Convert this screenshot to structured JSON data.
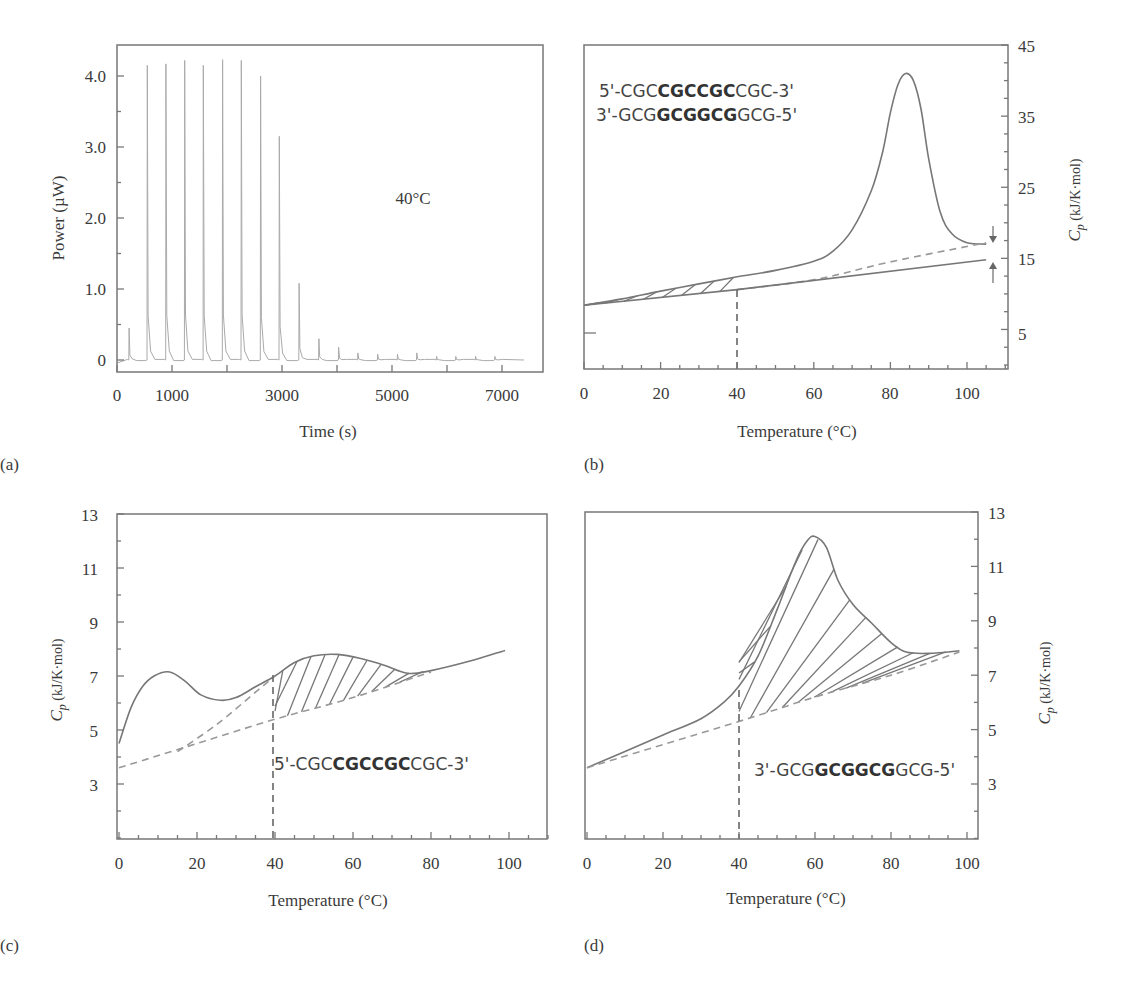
{
  "figure": {
    "panels": [
      {
        "id": "a",
        "label": "(a)"
      },
      {
        "id": "b",
        "label": "(b)"
      },
      {
        "id": "c",
        "label": "(c)"
      },
      {
        "id": "d",
        "label": "(d)"
      }
    ]
  },
  "panel_a": {
    "label": "(a)",
    "ylabel": "Power (µW)",
    "xlabel": "Time (s)",
    "annotation": "40°C",
    "yticks": [
      "0",
      "1.0",
      "2.0",
      "3.0",
      "4.0"
    ],
    "xticks": [
      "0",
      "1000",
      "3000",
      "5000",
      "7000"
    ]
  },
  "panel_b": {
    "label": "(b)",
    "xlabel": "Temperature (°C)",
    "ylabel_main": "C",
    "ylabel_sub": "p",
    "ylabel_units": " (kJ/K·mol)",
    "seq_top": {
      "pre": "5'-CGC",
      "bold": "CGCCGC",
      "post": "CGC-3'"
    },
    "seq_bottom": {
      "pre": "3'-GCG",
      "bold": "GCGGCG",
      "post": "GCG-5'"
    },
    "yticks": [
      "5",
      "15",
      "25",
      "35",
      "45"
    ],
    "xticks": [
      "0",
      "20",
      "40",
      "60",
      "80",
      "100"
    ]
  },
  "panel_c": {
    "label": "(c)",
    "xlabel": "Temperature (°C)",
    "ylabel_main": "C",
    "ylabel_sub": "p",
    "ylabel_units": " (kJ/K·mol)",
    "seq": {
      "pre": "5'-CGC",
      "bold": "CGCCGC",
      "post": "CGC-3'"
    },
    "yticks": [
      "3",
      "5",
      "7",
      "9",
      "11",
      "13"
    ],
    "xticks": [
      "0",
      "20",
      "40",
      "60",
      "80",
      "100"
    ]
  },
  "panel_d": {
    "label": "(d)",
    "xlabel": "Temperature (°C)",
    "ylabel_main": "C",
    "ylabel_sub": "p",
    "ylabel_units": " (kJ/K·mol)",
    "seq": {
      "pre": "3'-GCG",
      "bold": "GCGGCG",
      "post": "GCG-5'"
    },
    "yticks": [
      "3",
      "5",
      "7",
      "9",
      "11",
      "13"
    ],
    "xticks": [
      "0",
      "20",
      "40",
      "60",
      "80",
      "100"
    ]
  },
  "chart_data": [
    {
      "panel": "a",
      "type": "line",
      "title": "",
      "xlabel": "Time (s)",
      "ylabel": "Power (µW)",
      "annotations": [
        "40°C"
      ],
      "xlim": [
        0,
        7800
      ],
      "ylim": [
        -0.25,
        4.5
      ],
      "xticks": [
        0,
        1000,
        3000,
        5000,
        7000
      ],
      "yticks": [
        0,
        1.0,
        2.0,
        3.0,
        4.0
      ],
      "grid": false,
      "series": [
        {
          "name": "titration injection peaks",
          "peaks_x": [
            220,
            550,
            890,
            1230,
            1570,
            1920,
            2260,
            2610,
            2950,
            3310,
            3670,
            4030,
            4380,
            4740,
            5100,
            5450,
            5810,
            6160,
            6520,
            6870
          ],
          "peaks_y": [
            0.45,
            4.15,
            4.17,
            4.22,
            4.15,
            4.23,
            4.22,
            4.0,
            3.15,
            1.08,
            0.3,
            0.18,
            0.1,
            0.08,
            0.08,
            0.1,
            0.05,
            0.05,
            0.05,
            0.05
          ],
          "baseline": 0.0,
          "x_end": 7400
        }
      ]
    },
    {
      "panel": "b",
      "type": "line",
      "xlabel": "Temperature (°C)",
      "ylabel": "Cp (kJ/K·mol)",
      "y_axis_side": "right",
      "annotations": [
        "5'-CGCCGCCGCCGC-3'",
        "3'-GCGGCGGCGGCG-5'"
      ],
      "xlim": [
        0,
        110
      ],
      "ylim": [
        0,
        45
      ],
      "xticks": [
        0,
        20,
        40,
        60,
        80,
        100
      ],
      "yticks": [
        5,
        15,
        25,
        35,
        45
      ],
      "vertical_dashed_line_x": 40,
      "series": [
        {
          "name": "duplex melting curve",
          "style": "solid",
          "x": [
            0,
            10,
            20,
            30,
            40,
            50,
            60,
            65,
            70,
            75,
            78,
            80,
            82,
            84,
            86,
            88,
            90,
            93,
            96,
            100,
            105
          ],
          "y": [
            8.4,
            9.3,
            10.4,
            11.4,
            12.4,
            13.3,
            14.6,
            16.0,
            19.0,
            24.5,
            30.0,
            35.5,
            39.5,
            41.0,
            40.0,
            36.0,
            29.0,
            21.5,
            18.5,
            17.2,
            17.0
          ]
        },
        {
          "name": "dashed baseline",
          "style": "dashed",
          "x": [
            40,
            60,
            80,
            105
          ],
          "y": [
            10.6,
            12.0,
            14.5,
            17.2
          ]
        },
        {
          "name": "solid baseline",
          "style": "solid",
          "x": [
            0,
            40,
            105
          ],
          "y": [
            8.4,
            10.6,
            14.8
          ]
        },
        {
          "name": "hatched area",
          "range_x": [
            0,
            40
          ]
        }
      ]
    },
    {
      "panel": "c",
      "type": "line",
      "xlabel": "Temperature (°C)",
      "ylabel": "Cp (kJ/K·mol)",
      "annotations": [
        "5'-CGCCGCCGCCGC-3'"
      ],
      "xlim": [
        0,
        110
      ],
      "ylim": [
        1,
        13
      ],
      "xticks": [
        0,
        20,
        40,
        60,
        80,
        100
      ],
      "yticks": [
        3,
        5,
        7,
        9,
        11,
        13
      ],
      "vertical_dashed_line_x": 40,
      "series": [
        {
          "name": "single strand heat capacity",
          "style": "solid",
          "x": [
            0,
            3,
            6,
            9,
            13,
            17,
            21,
            26,
            30,
            35,
            40,
            45,
            50,
            56,
            62,
            68,
            74,
            80,
            90,
            99
          ],
          "y": [
            4.5,
            5.8,
            6.6,
            7.0,
            7.15,
            6.8,
            6.3,
            6.1,
            6.2,
            6.6,
            7.0,
            7.5,
            7.75,
            7.8,
            7.65,
            7.4,
            7.1,
            7.2,
            7.55,
            7.95
          ]
        },
        {
          "name": "dashed baseline low",
          "style": "dashed",
          "x": [
            0,
            20,
            40,
            60,
            80
          ],
          "y": [
            3.6,
            4.5,
            5.4,
            6.2,
            7.15
          ]
        },
        {
          "name": "dashed baseline high",
          "style": "dashed",
          "x": [
            15,
            25,
            35,
            40
          ],
          "y": [
            4.2,
            5.2,
            6.4,
            7.0
          ]
        },
        {
          "name": "hatched area",
          "range_x": [
            40,
            78
          ]
        }
      ]
    },
    {
      "panel": "d",
      "type": "line",
      "xlabel": "Temperature (°C)",
      "ylabel": "Cp (kJ/K·mol)",
      "y_axis_side": "right",
      "annotations": [
        "3'-GCGGCGGCGGCG-5'"
      ],
      "xlim": [
        0,
        103
      ],
      "ylim": [
        1,
        13
      ],
      "xticks": [
        0,
        20,
        40,
        60,
        80,
        100
      ],
      "yticks": [
        3,
        5,
        7,
        9,
        11,
        13
      ],
      "vertical_dashed_line_x": 40,
      "series": [
        {
          "name": "single strand heat capacity",
          "style": "solid",
          "x": [
            0,
            10,
            20,
            30,
            36,
            40,
            45,
            50,
            55,
            58,
            60,
            63,
            66,
            70,
            75,
            80,
            84,
            90,
            98
          ],
          "y": [
            3.6,
            4.2,
            4.8,
            5.4,
            6.0,
            6.6,
            7.7,
            9.4,
            11.2,
            11.95,
            12.1,
            11.7,
            10.5,
            9.6,
            8.9,
            8.2,
            7.85,
            7.8,
            7.9
          ]
        },
        {
          "name": "dashed baseline",
          "style": "dashed",
          "x": [
            0,
            40,
            60,
            80,
            98
          ],
          "y": [
            3.6,
            5.3,
            6.2,
            7.0,
            7.85
          ]
        },
        {
          "name": "hatched area",
          "range_x": [
            40,
            97
          ]
        }
      ]
    }
  ]
}
